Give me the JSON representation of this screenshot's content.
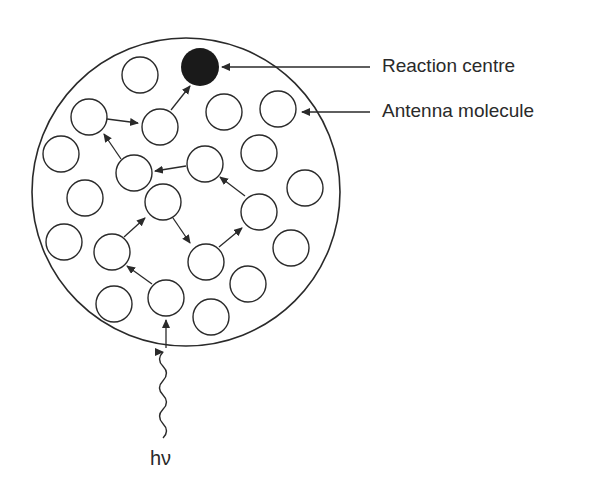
{
  "labels": {
    "reaction_centre": "Reaction centre",
    "antenna_molecule": "Antenna molecule",
    "photon": "hν"
  },
  "colors": {
    "stroke": "#2a2a2a",
    "reaction_centre_fill": "#1a1a1a",
    "background": "#ffffff"
  },
  "boundary": {
    "cx": 186,
    "cy": 192,
    "r": 154
  },
  "reaction_centre": {
    "cx": 200,
    "cy": 67,
    "r": 19
  },
  "antenna_molecules": [
    {
      "cx": 140,
      "cy": 75
    },
    {
      "cx": 89,
      "cy": 117
    },
    {
      "cx": 160,
      "cy": 127
    },
    {
      "cx": 224,
      "cy": 112
    },
    {
      "cx": 278,
      "cy": 109
    },
    {
      "cx": 61,
      "cy": 154
    },
    {
      "cx": 134,
      "cy": 173
    },
    {
      "cx": 205,
      "cy": 164
    },
    {
      "cx": 259,
      "cy": 153
    },
    {
      "cx": 305,
      "cy": 188
    },
    {
      "cx": 85,
      "cy": 198
    },
    {
      "cx": 163,
      "cy": 202
    },
    {
      "cx": 259,
      "cy": 212
    },
    {
      "cx": 64,
      "cy": 242
    },
    {
      "cx": 112,
      "cy": 252
    },
    {
      "cx": 206,
      "cy": 262
    },
    {
      "cx": 291,
      "cy": 248
    },
    {
      "cx": 114,
      "cy": 304
    },
    {
      "cx": 166,
      "cy": 298
    },
    {
      "cx": 248,
      "cy": 284
    },
    {
      "cx": 211,
      "cy": 317
    }
  ],
  "molecule_radius": 18,
  "energy_transfer_arrows": [
    {
      "x1": 166,
      "y1": 348,
      "x2": 166,
      "y2": 320
    },
    {
      "x1": 152,
      "y1": 284,
      "x2": 127,
      "y2": 266
    },
    {
      "x1": 124,
      "y1": 237,
      "x2": 145,
      "y2": 218
    },
    {
      "x1": 173,
      "y1": 218,
      "x2": 190,
      "y2": 243
    },
    {
      "x1": 219,
      "y1": 247,
      "x2": 242,
      "y2": 228
    },
    {
      "x1": 245,
      "y1": 196,
      "x2": 220,
      "y2": 177
    },
    {
      "x1": 186,
      "y1": 166,
      "x2": 155,
      "y2": 171
    },
    {
      "x1": 121,
      "y1": 159,
      "x2": 104,
      "y2": 134
    },
    {
      "x1": 107,
      "y1": 119,
      "x2": 138,
      "y2": 123
    },
    {
      "x1": 171,
      "y1": 110,
      "x2": 190,
      "y2": 86
    }
  ],
  "pointer_lines": [
    {
      "name": "reaction-centre-pointer",
      "x1": 370,
      "y1": 67,
      "x2": 222,
      "y2": 67
    },
    {
      "name": "antenna-molecule-pointer",
      "x1": 370,
      "y1": 112,
      "x2": 302,
      "y2": 112
    }
  ],
  "photon_wave": {
    "x": 163,
    "y_top": 352,
    "y_bottom": 438
  }
}
